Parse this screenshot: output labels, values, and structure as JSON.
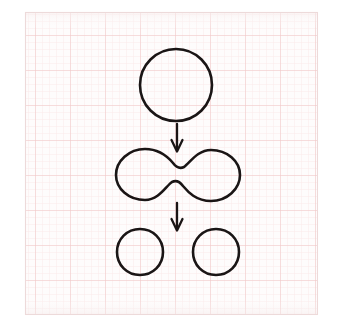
{
  "canvas": {
    "width": 341,
    "height": 330,
    "background_color": "#ffffff"
  },
  "paper": {
    "name": "graph-paper",
    "frame": {
      "x": 25,
      "y": 12,
      "width": 293,
      "height": 303
    },
    "background_color": "#fefdfd",
    "border_color": "#efdede",
    "minor_grid_color": "#fbeaea",
    "major_grid_color": "#f2c9c9",
    "minor_grid_spacing": 7,
    "major_grid_spacing": 35
  },
  "drawing": {
    "title": "Cell division sequence",
    "stroke_color": "#1a1515",
    "stroke_width": 2.6,
    "fill": "none",
    "style": "hand-drawn ink on graph paper"
  },
  "shapes": {
    "parent_cell": {
      "label": "parent-cell",
      "type": "circle",
      "cx": 176,
      "cy": 85,
      "r": 36
    },
    "dividing_cell": {
      "label": "dividing-cell",
      "type": "dumbbell",
      "cx": 178,
      "cy": 175,
      "width": 130,
      "height": 52,
      "left_lobe_cx": 145,
      "right_lobe_cx": 211,
      "lobe_r": 26,
      "waist_gap": 11
    },
    "daughter_cell_left": {
      "label": "daughter-cell-left",
      "type": "circle",
      "cx": 140,
      "cy": 252,
      "r": 23
    },
    "daughter_cell_right": {
      "label": "daughter-cell-right",
      "type": "circle",
      "cx": 216,
      "cy": 252,
      "r": 23
    }
  },
  "arrows": {
    "first": {
      "label": "arrow-parent-to-dividing",
      "x": 177,
      "y_start": 124,
      "y_end": 150,
      "head_width": 11,
      "head_length": 11
    },
    "second": {
      "label": "arrow-dividing-to-daughters",
      "x": 177,
      "y_start": 203,
      "y_end": 229,
      "head_width": 11,
      "head_length": 11
    }
  }
}
